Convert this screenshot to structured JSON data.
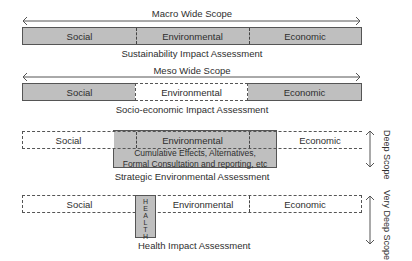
{
  "rows": [
    {
      "id": "macro",
      "scope_label": "Macro Wide Scope",
      "cells": [
        "Social",
        "Environmental",
        "Economic"
      ],
      "caption": "Sustainability Impact Assessment",
      "shaded": [
        "Social",
        "Environmental",
        "Economic"
      ]
    },
    {
      "id": "meso",
      "scope_label": "Meso Wide Scope",
      "cells": [
        "Social",
        "Environmental",
        "Economic"
      ],
      "caption": "Socio-economic Impact Assessment",
      "shaded": [
        "Social",
        "Economic"
      ]
    },
    {
      "id": "sea",
      "scope_label": "Deep Scope",
      "cells": [
        "Social",
        "Environmental",
        "Economic"
      ],
      "note_line1": "Cumulative Effects, Alternatives,",
      "note_line2": "Formal Consultation and reporting, etc",
      "caption": "Strategic Environmental Assessment",
      "shaded": [
        "Environmental"
      ]
    },
    {
      "id": "hia",
      "scope_label": "Very Deep Scope",
      "cells": [
        "Social",
        "Environmental",
        "Economic"
      ],
      "health_letters": [
        "H",
        "E",
        "A",
        "L",
        "T",
        "H"
      ],
      "caption": "Health Impact Assessment",
      "shaded": [
        "Health"
      ]
    }
  ],
  "colors": {
    "shade": "#bfbfbf",
    "line": "#555555",
    "text": "#2e2e2e"
  }
}
